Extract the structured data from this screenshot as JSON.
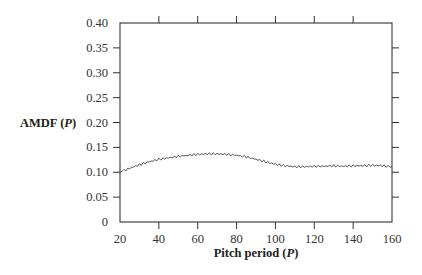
{
  "chart_data": {
    "type": "line",
    "title": "",
    "xlabel": "Pitch period (P)",
    "ylabel": "AMDF (P)",
    "xlim": [
      20,
      160
    ],
    "ylim": [
      0,
      0.4
    ],
    "xticks": [
      20,
      40,
      60,
      80,
      100,
      120,
      140,
      160
    ],
    "xtick_labels": [
      "20",
      "40",
      "60",
      "80",
      "100",
      "120",
      "140",
      "160"
    ],
    "yticks": [
      0,
      0.05,
      0.1,
      0.15,
      0.2,
      0.25,
      0.3,
      0.35,
      0.4
    ],
    "ytick_labels": [
      "0",
      "0.05",
      "0.10",
      "0.15",
      "0.20",
      "0.25",
      "0.30",
      "0.35",
      "0.40"
    ],
    "grid": false,
    "legend": null,
    "series": [
      {
        "name": "AMDF",
        "color": "#444444",
        "x": [
          20,
          25,
          30,
          35,
          40,
          45,
          50,
          55,
          60,
          65,
          70,
          75,
          80,
          85,
          90,
          95,
          100,
          105,
          110,
          115,
          120,
          125,
          130,
          135,
          140,
          145,
          150,
          155,
          160
        ],
        "y": [
          0.1,
          0.108,
          0.115,
          0.121,
          0.126,
          0.129,
          0.132,
          0.134,
          0.136,
          0.137,
          0.137,
          0.136,
          0.134,
          0.131,
          0.126,
          0.121,
          0.116,
          0.113,
          0.111,
          0.111,
          0.112,
          0.112,
          0.113,
          0.112,
          0.113,
          0.113,
          0.114,
          0.113,
          0.111
        ]
      }
    ]
  },
  "labels": {
    "xlabel_main": "Pitch period (",
    "xlabel_var": "P",
    "xlabel_close": ")",
    "ylabel_main": "AMDF (",
    "ylabel_var": "P",
    "ylabel_close": ")"
  }
}
